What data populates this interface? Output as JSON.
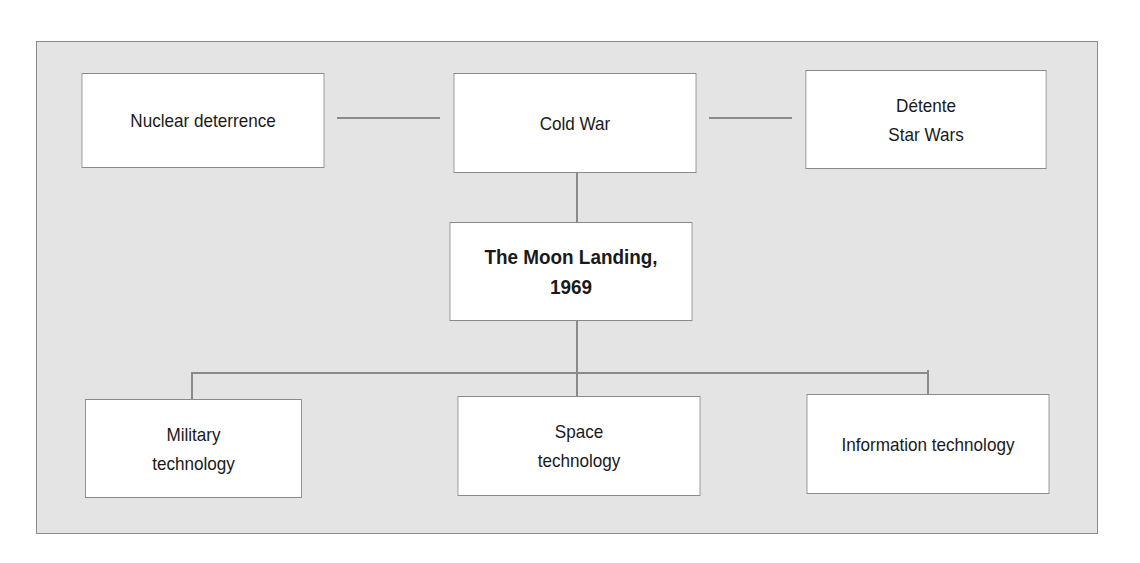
{
  "diagram": {
    "type": "concept-map",
    "colors": {
      "frame_bg": "#e4e4e4",
      "box_bg": "#ffffff",
      "border": "#8a8a8a",
      "text": "#1a1a1a"
    },
    "nodes": {
      "nuclear": {
        "label": "Nuclear deterrence"
      },
      "cold_war": {
        "label": "Cold War"
      },
      "detente": {
        "label": "Détente\nStar Wars"
      },
      "moon": {
        "label": "The Moon Landing,\n1969"
      },
      "military": {
        "label": "Military\ntechnology"
      },
      "space": {
        "label": "Space\ntechnology"
      },
      "info": {
        "label": "Information technology"
      }
    },
    "edges": [
      [
        "nuclear",
        "cold_war"
      ],
      [
        "cold_war",
        "detente"
      ],
      [
        "cold_war",
        "moon"
      ],
      [
        "moon",
        "military"
      ],
      [
        "moon",
        "space"
      ],
      [
        "moon",
        "info"
      ]
    ]
  }
}
